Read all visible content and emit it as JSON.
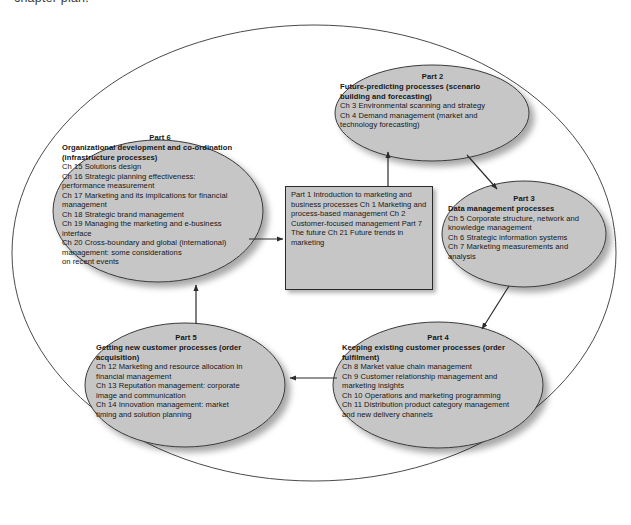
{
  "caption": "chapter plan.",
  "colors": {
    "node_fill": "#c6c6c6",
    "node_stroke": "#3a3a3a",
    "outer_stroke": "#4a4a4a",
    "arrow": "#2b2b2b",
    "text": "#161616",
    "page_background": "#ffffff"
  },
  "diagram": {
    "outer_ellipse_label": "process cycle boundary",
    "center": {
      "part1_label": "Part 1",
      "part1_heading_line1": "Introduction to marketing and",
      "part1_heading_line2": "business processes",
      "part1_chapters": [
        "Ch 1 Marketing and process-based",
        "management",
        "Ch 2 Customer-focused",
        "management"
      ],
      "part7_label": "Part 7",
      "part7_heading": "The future",
      "part7_chapters": [
        "Ch 21 Future trends in marketing"
      ]
    },
    "nodes": [
      {
        "id": "part6",
        "part_label": "Part 6",
        "heading_lines": [
          "Organizational development and co-ordination",
          "(infrastructure processes)"
        ],
        "chapter_lines": [
          "Ch 15 Solutions design",
          "Ch 16 Strategic planning effectiveness:",
          "performance measurement",
          "Ch 17 Marketing and its implications for financial",
          "management",
          "Ch 18 Strategic brand management",
          "Ch 19 Managing the marketing and e-business",
          "interface",
          "Ch 20 Cross-boundary and global (international)",
          "management: some considerations",
          "on recent events"
        ]
      },
      {
        "id": "part2",
        "part_label": "Part 2",
        "heading_lines": [
          "Future-predicting processes (scenario",
          "building and forecasting)"
        ],
        "chapter_lines": [
          "Ch 3 Environmental scanning and strategy",
          "Ch 4 Demand management (market and",
          "technology forecasting)"
        ]
      },
      {
        "id": "part3",
        "part_label": "Part 3",
        "heading_lines": [
          "Data management processes"
        ],
        "chapter_lines": [
          "Ch 5 Corporate structure, network and",
          "knowledge management",
          "Ch 6 Strategic information systems",
          "Ch 7 Marketing measurements and",
          "analysis"
        ]
      },
      {
        "id": "part4",
        "part_label": "Part 4",
        "heading_lines": [
          "Keeping existing customer processes (order",
          "fulfilment)"
        ],
        "chapter_lines": [
          "Ch 8 Market value chain management",
          "Ch 9 Customer relationship management and",
          "marketing insights",
          "Ch 10 Operations and marketing programming",
          "Ch 11 Distribution product category management",
          "and new delivery channels"
        ]
      },
      {
        "id": "part5",
        "part_label": "Part 5",
        "heading_lines": [
          "Getting new customer processes (order",
          "acquisition)"
        ],
        "chapter_lines": [
          "Ch 12 Marketing and resource allocation in",
          "financial management",
          "Ch 13 Reputation management: corporate",
          "image and communication",
          "Ch 14 Innovation management: market",
          "timing and solution planning"
        ]
      }
    ],
    "arrows": [
      {
        "id": "center-to-part2",
        "from": "Part 1 / Part 7 centre box",
        "to": "Part 2"
      },
      {
        "id": "part2-to-part3",
        "from": "Part 2",
        "to": "Part 3"
      },
      {
        "id": "part3-to-part4",
        "from": "Part 3",
        "to": "Part 4"
      },
      {
        "id": "part4-to-part5",
        "from": "Part 4",
        "to": "Part 5"
      },
      {
        "id": "part5-to-part6",
        "from": "Part 5",
        "to": "Part 6"
      },
      {
        "id": "part6-to-center",
        "from": "Part 6",
        "to": "Part 1 / Part 7 centre box"
      }
    ]
  }
}
